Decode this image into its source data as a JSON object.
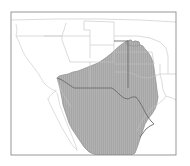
{
  "figure": {
    "type": "range-distribution-map",
    "region": "Southwestern United States and Northern Mexico",
    "background_color": "#ffffff",
    "frame": {
      "stroke_color": "#8c8c8c",
      "fill_color": "#ffffff",
      "x": 11,
      "y": 12,
      "width": 165,
      "height": 143
    },
    "boundaries": {
      "state_line_color": "#c2c2c2",
      "coastline_color": "#c8c8c8",
      "country_line_color": "#6b6b6b",
      "state_line_width": 0.6,
      "country_line_width": 0.9
    },
    "shaded_range": {
      "label": "shaded distribution area",
      "fill_color": "#a6a6a6",
      "hatch_color": "#b8b8b8",
      "hatch_pattern": "fine-vertical-lines",
      "outline_color": "#8f8f8f",
      "covers": [
        "Arizona",
        "New Mexico",
        "West Texas",
        "Sonora",
        "Chihuahua",
        "Coahuila",
        "Durango",
        "Zacatecas",
        "southeastern Colorado edge",
        "Oklahoma panhandle edge"
      ]
    },
    "unshaded_areas": [
      "California",
      "Nevada",
      "Oregon",
      "Idaho",
      "Utah",
      "Wyoming",
      "Colorado",
      "Nebraska",
      "Kansas",
      "Oklahoma",
      "East Texas",
      "Baja California",
      "Pacific Ocean",
      "Gulf of Mexico"
    ],
    "labels": [],
    "legend": null,
    "title": null
  }
}
